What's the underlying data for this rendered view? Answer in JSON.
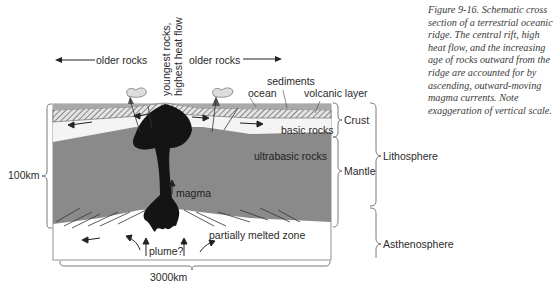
{
  "figure": {
    "caption": "Figure 9-16. Schematic cross section of a terrestrial oceanic ridge. The central rift, high heat flow, and the increasing age of rocks outward from the ridge are accounted for by ascending, outward-moving magma currents. Note exaggeration of vertical scale."
  },
  "labels": {
    "older_rocks_left": "older rocks",
    "older_rocks_right": "older rocks",
    "youngest_rocks_line1": "youngest rocks,",
    "youngest_rocks_line2": "highest heat flow",
    "sediments": "sediments",
    "ocean": "ocean",
    "volcanic_layer": "volcanic layer",
    "basic_rocks": "basic rocks",
    "ultrabasic_rocks": "ultrabasic rocks",
    "magma": "magma",
    "plume": "plume?",
    "partially_melted_zone": "partially melted zone"
  },
  "scale": {
    "vertical": "100km",
    "horizontal": "3000km"
  },
  "brackets": {
    "crust": "Crust",
    "mantle": "Mantle",
    "lithosphere": "Lithosphere",
    "asthenosphere": "Asthenosphere"
  },
  "colors": {
    "ocean": "#a9a9a9",
    "volcanic_layer": "#cfcfcf",
    "basic_rocks": "#f4f4f4",
    "ultrabasic_mantle": "#8a8a8a",
    "magma": "#141414",
    "asthenosphere": "#ffffff",
    "line": "#333333"
  }
}
